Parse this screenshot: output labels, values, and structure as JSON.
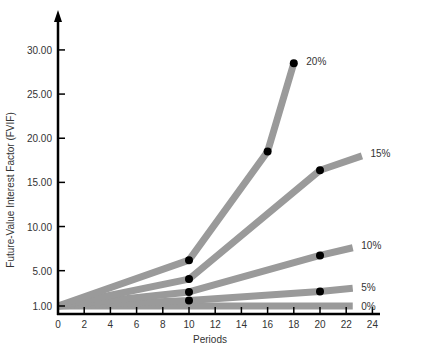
{
  "chart_data": {
    "type": "line",
    "title": "",
    "xlabel": "Periods",
    "ylabel": "Future-Value Interest Factor (FVIF)",
    "xlim": [
      0,
      24
    ],
    "ylim": [
      1,
      30
    ],
    "x_ticks": [
      0,
      2,
      4,
      6,
      8,
      10,
      12,
      14,
      16,
      18,
      20,
      22,
      24
    ],
    "y_ticks": [
      {
        "value": 1,
        "label": "1.00"
      },
      {
        "value": 5,
        "label": "5.00"
      },
      {
        "value": 10,
        "label": "10.00"
      },
      {
        "value": 15,
        "label": "15.00"
      },
      {
        "value": 20,
        "label": "20.00"
      },
      {
        "value": 25,
        "label": "25.00"
      },
      {
        "value": 30,
        "label": "30.00"
      }
    ],
    "grid": false,
    "legend_position": "inline-right",
    "series": [
      {
        "name": "0%",
        "points": [
          [
            0,
            1.0
          ],
          [
            10,
            1.0
          ],
          [
            22.5,
            1.0
          ]
        ],
        "markers": [],
        "label_at": [
          23,
          1.0
        ]
      },
      {
        "name": "5%",
        "points": [
          [
            0,
            1.0
          ],
          [
            10,
            1.63
          ],
          [
            20,
            2.65
          ],
          [
            22.5,
            3.0
          ]
        ],
        "markers": [
          [
            10,
            1.63
          ],
          [
            20,
            2.65
          ]
        ],
        "label_at": [
          23,
          3.2
        ]
      },
      {
        "name": "10%",
        "points": [
          [
            0,
            1.0
          ],
          [
            10,
            2.59
          ],
          [
            20,
            6.73
          ],
          [
            22.5,
            7.6
          ]
        ],
        "markers": [
          [
            10,
            2.59
          ],
          [
            20,
            6.73
          ]
        ],
        "label_at": [
          23,
          7.9
        ]
      },
      {
        "name": "15%",
        "points": [
          [
            0,
            1.0
          ],
          [
            10,
            4.05
          ],
          [
            20,
            16.37
          ],
          [
            23.2,
            18.0
          ]
        ],
        "markers": [
          [
            10,
            4.05
          ],
          [
            20,
            16.37
          ]
        ],
        "label_at": [
          23.7,
          18.3
        ]
      },
      {
        "name": "20%",
        "points": [
          [
            0,
            1.0
          ],
          [
            10,
            6.19
          ],
          [
            16,
            18.49
          ],
          [
            18,
            28.5
          ]
        ],
        "markers": [
          [
            10,
            6.19
          ],
          [
            16,
            18.49
          ],
          [
            18,
            28.5
          ]
        ],
        "label_at": [
          18.8,
          28.8
        ]
      }
    ],
    "line_color": "#9a9a9a",
    "marker_color": "#000000",
    "axis_color": "#000000"
  }
}
